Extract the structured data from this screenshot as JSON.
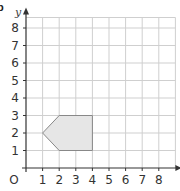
{
  "part_label": "b",
  "chart_data": {
    "type": "scatter",
    "title": "",
    "xlabel": "x",
    "ylabel": "y",
    "origin_label": "O",
    "xlim": [
      0,
      9
    ],
    "ylim": [
      0,
      8.6
    ],
    "x_ticks": [
      "1",
      "2",
      "3",
      "4",
      "5",
      "6",
      "7",
      "8"
    ],
    "y_ticks": [
      "1",
      "2",
      "3",
      "4",
      "5",
      "6",
      "7",
      "8"
    ],
    "grid": true,
    "shapes": [
      {
        "name": "pentagon",
        "vertices": [
          [
            1,
            2
          ],
          [
            2,
            3
          ],
          [
            4,
            3
          ],
          [
            4,
            1
          ],
          [
            2,
            1
          ]
        ],
        "fill": "#e6e6e6",
        "stroke": "#888888"
      }
    ]
  },
  "colors": {
    "grid": "#cfcfcf",
    "axis": "#333333"
  }
}
